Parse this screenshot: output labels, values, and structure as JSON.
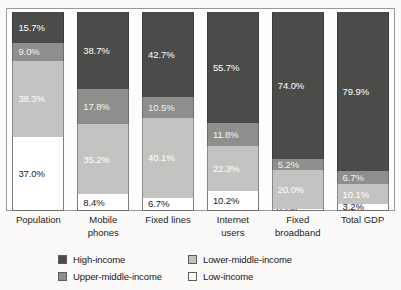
{
  "chart_data": {
    "type": "bar",
    "subtype": "stacked-100-percent",
    "title": "",
    "xlabel": "",
    "ylabel": "",
    "ylim": [
      0,
      100
    ],
    "grid": false,
    "legend_position": "bottom",
    "categories": [
      "Population",
      "Mobile phones",
      "Fixed lines",
      "Internet users",
      "Fixed broadband",
      "Total GDP"
    ],
    "category_lines": [
      [
        "Population"
      ],
      [
        "Mobile",
        "phones"
      ],
      [
        "Fixed lines"
      ],
      [
        "Internet",
        "users"
      ],
      [
        "Fixed",
        "broadband"
      ],
      [
        "Total GDP"
      ]
    ],
    "series": [
      {
        "name": "High-income",
        "color": "#4b4b49",
        "values": [
          15.7,
          38.7,
          42.7,
          55.7,
          74.0,
          79.9
        ],
        "labels": [
          "15.7%",
          "38.7%",
          "42.7%",
          "55.7%",
          "74.0%",
          "79.9%"
        ]
      },
      {
        "name": "Upper-middle-income",
        "color": "#8e8e8c",
        "values": [
          9.0,
          17.8,
          10.5,
          11.8,
          5.2,
          6.7
        ],
        "labels": [
          "9.0%",
          "17.8%",
          "10.5%",
          "11.8%",
          "5.2%",
          "6.7%"
        ]
      },
      {
        "name": "Lower-middle-income",
        "color": "#c3c3c1",
        "values": [
          38.3,
          35.2,
          40.1,
          22.3,
          20.0,
          10.1
        ],
        "labels": [
          "38.3%",
          "35.2%",
          "40.1%",
          "22.3%",
          "20.0%",
          "10.1%"
        ]
      },
      {
        "name": "Low-income",
        "color": "#ffffff",
        "values": [
          37.0,
          8.4,
          6.7,
          10.2,
          0.7,
          3.2
        ],
        "labels": [
          "37.0%",
          "8.4%",
          "6.7%",
          "10.2%",
          "0.7%",
          "3.2%"
        ]
      }
    ]
  },
  "legend": {
    "items": [
      {
        "label": "High-income",
        "color": "#4b4b49"
      },
      {
        "label": "Lower-middle-income",
        "color": "#c3c3c1"
      },
      {
        "label": "Upper-middle-income",
        "color": "#8e8e8c"
      },
      {
        "label": "Low-income",
        "color": "#ffffff"
      }
    ]
  }
}
